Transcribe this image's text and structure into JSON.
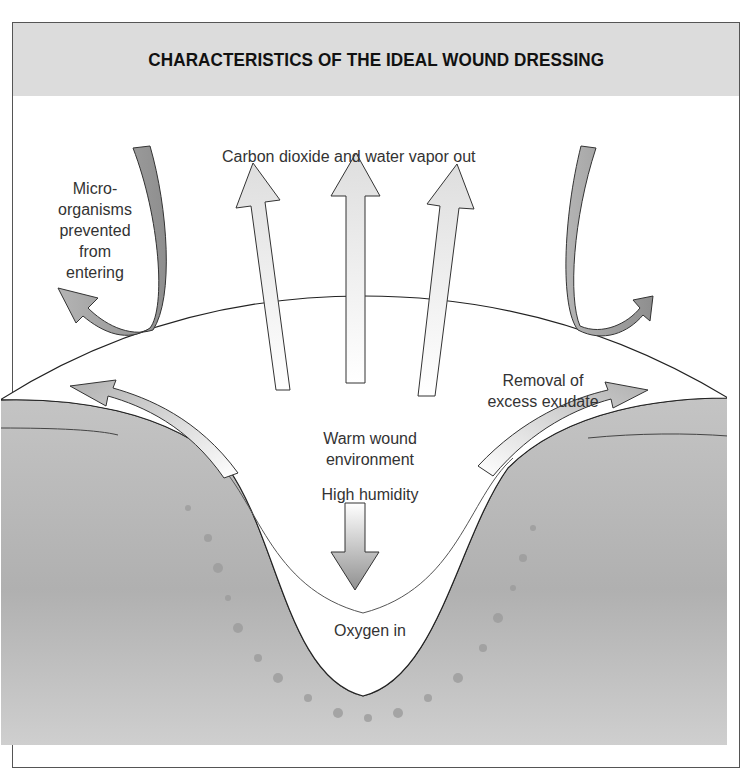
{
  "title": "CHARACTERISTICS OF THE IDEAL WOUND DRESSING",
  "labels": {
    "co2_out": "Carbon dioxide and water vapor out",
    "micro_1": "Micro-",
    "micro_2": "organisms",
    "micro_3": "prevented",
    "micro_4": "from",
    "micro_5": "entering",
    "exudate_1": "Removal of",
    "exudate_2": "excess exudate",
    "warm_1": "Warm wound",
    "warm_2": "environment",
    "humidity": "High humidity",
    "oxygen": "Oxygen in"
  },
  "colors": {
    "header_bg": "#dcdcdc",
    "tissue": "#b8b8b8",
    "tissue_dark": "#a8a8a8",
    "dressing": "#ffffff",
    "arrow_light": "#e4e4e4",
    "arrow_dark": "#a0a0a0",
    "outline": "#333333"
  }
}
